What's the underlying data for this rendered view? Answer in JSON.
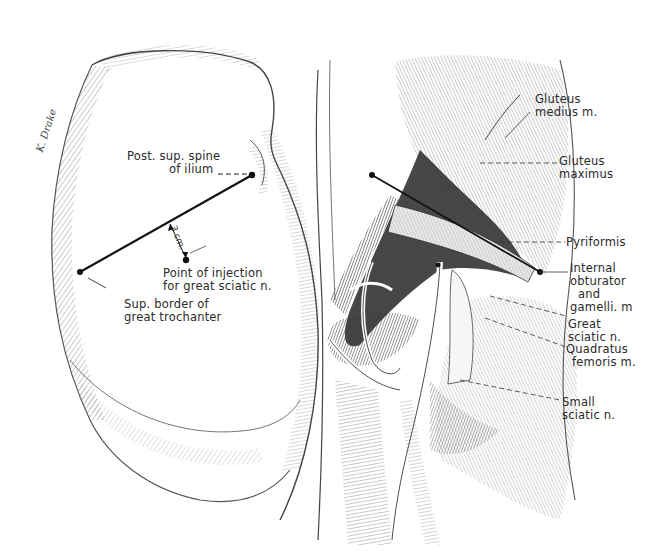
{
  "figure": {
    "type": "anatomical-illustration",
    "left_panel": {
      "subject": "gluteal region surface view",
      "signature": "K. Drake",
      "labels": [
        {
          "id": "post-sup-spine",
          "lines": [
            "Post. sup. spine",
            "of ilium"
          ]
        },
        {
          "id": "injection-point",
          "lines": [
            "Point of injection",
            "for great sciatic n."
          ]
        },
        {
          "id": "sup-border-trochanter",
          "lines": [
            "Sup. border of",
            "great trochanter"
          ]
        }
      ],
      "measurement": "3 cm."
    },
    "right_panel": {
      "subject": "gluteal region dissection",
      "labels": [
        {
          "id": "gluteus-medius",
          "lines": [
            "Gluteus",
            "medius m."
          ]
        },
        {
          "id": "gluteus-maximus",
          "lines": [
            "Gluteus",
            "maximus"
          ]
        },
        {
          "id": "pyriformis",
          "lines": [
            "Pyriformis"
          ]
        },
        {
          "id": "internal-obturator",
          "lines": [
            "Internal",
            "obturator",
            "and",
            "gamelli. m"
          ]
        },
        {
          "id": "great-sciatic",
          "lines": [
            "Great",
            "sciatic n."
          ]
        },
        {
          "id": "quadratus-femoris",
          "lines": [
            "Quadratus",
            "femoris m."
          ]
        },
        {
          "id": "small-sciatic",
          "lines": [
            "Small",
            "sciatic n."
          ]
        }
      ]
    },
    "colors": {
      "ink": "#1a1a1a",
      "paper": "#ffffff",
      "hatch": "#555555",
      "dark_tissue": "#2e2e2e"
    }
  }
}
